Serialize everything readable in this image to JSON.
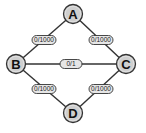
{
  "diagram": {
    "type": "flow-network",
    "colors": {
      "background": "#ffffff",
      "node_fill": "#cfcfcf",
      "node_stroke": "#333333",
      "edge_stroke": "#333333",
      "label_fill": "#e6e6e6"
    },
    "nodes": [
      {
        "id": "A",
        "label": "A",
        "x": 73,
        "y": 14
      },
      {
        "id": "B",
        "label": "B",
        "x": 16,
        "y": 64
      },
      {
        "id": "C",
        "label": "C",
        "x": 126,
        "y": 64
      },
      {
        "id": "D",
        "label": "D",
        "x": 73,
        "y": 113
      }
    ],
    "edges": [
      {
        "from": "A",
        "to": "B",
        "label": "0/1000",
        "lx": 44,
        "ly": 40
      },
      {
        "from": "A",
        "to": "C",
        "label": "0/1000",
        "lx": 101,
        "ly": 40
      },
      {
        "from": "B",
        "to": "C",
        "label": "0/1",
        "lx": 71,
        "ly": 64
      },
      {
        "from": "B",
        "to": "D",
        "label": "0/1000",
        "lx": 44,
        "ly": 89
      },
      {
        "from": "C",
        "to": "D",
        "label": "0/1000",
        "lx": 101,
        "ly": 89
      }
    ]
  }
}
